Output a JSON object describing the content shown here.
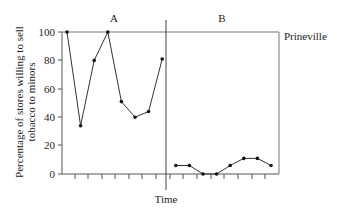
{
  "chart_data": {
    "type": "line",
    "title": "",
    "xlabel": "Time",
    "ylabel": "Percentage of stores willing to sell tobacco to minors",
    "ylabel_lines": [
      "Percentage of stores willing to sell",
      "tobacco to minors"
    ],
    "ylim": [
      0,
      100
    ],
    "yticks": [
      0,
      20,
      40,
      60,
      80,
      100
    ],
    "ytick_labels": [
      "0",
      "20",
      "40",
      "60",
      "80",
      "100"
    ],
    "grid": false,
    "legend": "none",
    "series_label": "Prineville",
    "phases": [
      {
        "label": "A",
        "x": [
          1,
          2,
          3,
          4,
          5,
          6,
          7,
          8
        ],
        "values": [
          100,
          34,
          80,
          100,
          51,
          40,
          44,
          81
        ]
      },
      {
        "label": "B",
        "x": [
          9,
          10,
          11,
          12,
          13,
          14,
          15,
          16
        ],
        "values": [
          6,
          6,
          0,
          0,
          6,
          11,
          11,
          6
        ]
      }
    ],
    "annotations": [
      "A",
      "B",
      "Prineville"
    ]
  },
  "labels": {
    "phase_a": "A",
    "phase_b": "B",
    "series": "Prineville",
    "xlabel": "Time",
    "ylabel_line1": "Percentage of stores willing to sell",
    "ylabel_line2": "tobacco to minors",
    "y0": "0",
    "y20": "20",
    "y40": "40",
    "y60": "60",
    "y80": "80",
    "y100": "100"
  }
}
